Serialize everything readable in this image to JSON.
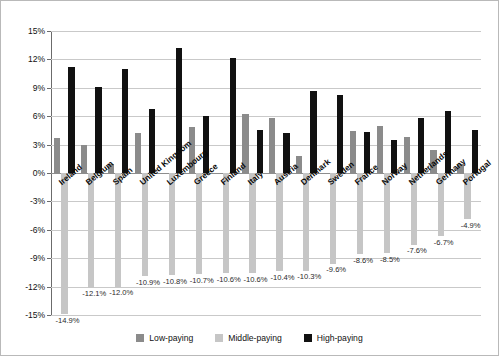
{
  "chart_data": {
    "type": "bar",
    "title": "",
    "xlabel": "",
    "ylabel": "",
    "ylim": [
      -15,
      15
    ],
    "ytick_labels": [
      "15%",
      "12%",
      "9%",
      "6%",
      "3%",
      "0%",
      "-3%",
      "-6%",
      "-9%",
      "-12%",
      "-15%"
    ],
    "ytick_values": [
      15,
      12,
      9,
      6,
      3,
      0,
      -3,
      -6,
      -9,
      -12,
      -15
    ],
    "grid": true,
    "legend_position": "bottom",
    "categories": [
      "Ireland",
      "Belgium",
      "Spain",
      "United Kingdom",
      "Luxembourg",
      "Greece",
      "Finland",
      "Italy",
      "Austria",
      "Denmark",
      "Sweden",
      "France",
      "Norway",
      "Netherlands",
      "Germany",
      "Portugal"
    ],
    "series": [
      {
        "name": "Low-paying",
        "color": "#8b8b8b",
        "values": [
          3.7,
          3.0,
          1.0,
          4.2,
          0.0,
          4.9,
          0.0,
          6.2,
          5.8,
          1.8,
          0.0,
          4.4,
          5.0,
          3.8,
          2.4,
          0.9
        ]
      },
      {
        "name": "Middle-paying",
        "color": "#c6c6c6",
        "values": [
          -14.9,
          -12.1,
          -12.0,
          -10.9,
          -10.8,
          -10.7,
          -10.6,
          -10.6,
          -10.4,
          -10.3,
          -9.6,
          -8.6,
          -8.5,
          -7.6,
          -6.7,
          -4.9
        ]
      },
      {
        "name": "High-paying",
        "color": "#111111",
        "values": [
          11.2,
          9.1,
          11.0,
          6.8,
          13.2,
          6.0,
          12.1,
          4.5,
          4.2,
          8.7,
          8.2,
          4.3,
          3.5,
          5.8,
          6.5,
          4.5
        ]
      }
    ],
    "negative_data_labels": [
      "-14.9%",
      "-12.1%",
      "-12.0%",
      "-10.9%",
      "-10.8%",
      "-10.7%",
      "-10.6%",
      "-10.6%",
      "-10.4%",
      "-10.3%",
      "-9.6%",
      "-8.6%",
      "-8.5%",
      "-7.6%",
      "-6.7%",
      "-4.9%"
    ]
  },
  "legend": {
    "items": [
      {
        "label": "Low-paying",
        "swatch": "low"
      },
      {
        "label": "Middle-paying",
        "swatch": "mid"
      },
      {
        "label": "High-paying",
        "swatch": "high"
      }
    ]
  }
}
